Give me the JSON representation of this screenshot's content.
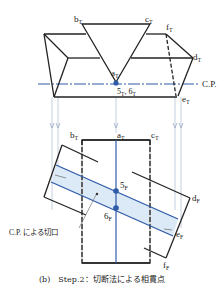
{
  "top_view": {
    "labels": {
      "b": "b",
      "b_sub": "T",
      "c": "c",
      "c_sub": "T",
      "f": "f",
      "f_sub": "T",
      "d": "d",
      "d_sub": "T",
      "a": "a",
      "a_sub": "T",
      "e": "e",
      "e_sub": "T",
      "points56": "5",
      "points56_sub": "T",
      "points56_sep": ", 6",
      "points56_sub2": "T"
    },
    "cutting_plane_label": "C.P."
  },
  "front_view": {
    "labels": {
      "b": "b",
      "b_sub": "T",
      "a": "a",
      "a_sub": "T",
      "c": "c",
      "c_sub": "T",
      "d": "d",
      "d_sub": "F",
      "e": "e",
      "e_sub": "F",
      "f": "f",
      "f_sub": "F",
      "p5": "5",
      "p5_sub": "F",
      "p6": "6",
      "p6_sub": "F"
    },
    "cut_label": "C.P. による切口"
  },
  "caption": "(b)　Step.2：切断法による相貫点",
  "colors": {
    "line": "#222222",
    "blue": "#2f5aa8",
    "blue_fill": "#dbeaf6",
    "projection": "#b8c4d8"
  }
}
